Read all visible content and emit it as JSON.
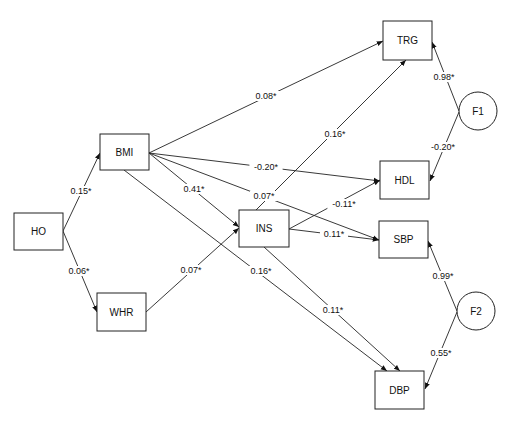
{
  "diagram": {
    "type": "path-diagram",
    "nodes": [
      {
        "id": "HO",
        "label": "HO",
        "shape": "rect",
        "x": 14,
        "y": 213,
        "w": 49,
        "h": 37
      },
      {
        "id": "BMI",
        "label": "BMI",
        "shape": "rect",
        "x": 100,
        "y": 134,
        "w": 49,
        "h": 36
      },
      {
        "id": "WHR",
        "label": "WHR",
        "shape": "rect",
        "x": 97,
        "y": 293,
        "w": 49,
        "h": 38
      },
      {
        "id": "INS",
        "label": "INS",
        "shape": "rect",
        "x": 239,
        "y": 210,
        "w": 50,
        "h": 37
      },
      {
        "id": "TRG",
        "label": "TRG",
        "shape": "rect",
        "x": 383,
        "y": 21,
        "w": 49,
        "h": 39
      },
      {
        "id": "HDL",
        "label": "HDL",
        "shape": "rect",
        "x": 380,
        "y": 161,
        "w": 49,
        "h": 38
      },
      {
        "id": "SBP",
        "label": "SBP",
        "shape": "rect",
        "x": 379,
        "y": 221,
        "w": 49,
        "h": 37
      },
      {
        "id": "DBP",
        "label": "DBP",
        "shape": "rect",
        "x": 375,
        "y": 371,
        "w": 49,
        "h": 38
      },
      {
        "id": "F1",
        "label": "F1",
        "shape": "circle",
        "cx": 478,
        "cy": 111,
        "r": 19
      },
      {
        "id": "F2",
        "label": "F2",
        "shape": "circle",
        "cx": 476,
        "cy": 311,
        "r": 19
      }
    ],
    "edges": [
      {
        "from": "HO",
        "to": "BMI",
        "label": "0.15*",
        "x1": 63,
        "y1": 231,
        "x2": 100,
        "y2": 153,
        "lx": 81,
        "ly": 191
      },
      {
        "from": "HO",
        "to": "WHR",
        "label": "0.06*",
        "x1": 63,
        "y1": 231,
        "x2": 97,
        "y2": 312,
        "lx": 79,
        "ly": 271
      },
      {
        "from": "BMI",
        "to": "TRG",
        "label": "0.08*",
        "x1": 149,
        "y1": 153,
        "x2": 383,
        "y2": 41,
        "lx": 266,
        "ly": 96
      },
      {
        "from": "BMI",
        "to": "HDL",
        "label": "-0.20*",
        "x1": 149,
        "y1": 153,
        "x2": 380,
        "y2": 181,
        "lx": 266,
        "ly": 167
      },
      {
        "from": "BMI",
        "to": "INS",
        "label": "0.41*",
        "x1": 149,
        "y1": 153,
        "x2": 239,
        "y2": 227,
        "lx": 194,
        "ly": 189
      },
      {
        "from": "BMI",
        "to": "SBP",
        "label": "0.07*",
        "x1": 149,
        "y1": 153,
        "x2": 379,
        "y2": 240,
        "lx": 264,
        "ly": 196
      },
      {
        "from": "BMI",
        "to": "DBP",
        "label": "0.16*",
        "x1": 124,
        "y1": 170,
        "x2": 387,
        "y2": 371,
        "lx": 261,
        "ly": 271
      },
      {
        "from": "WHR",
        "to": "INS",
        "label": "0.07*",
        "x1": 146,
        "y1": 312,
        "x2": 239,
        "y2": 228,
        "lx": 191,
        "ly": 270
      },
      {
        "from": "INS",
        "to": "TRG",
        "label": "0.16*",
        "x1": 256,
        "y1": 210,
        "x2": 406,
        "y2": 60,
        "lx": 335,
        "ly": 134
      },
      {
        "from": "INS",
        "to": "HDL",
        "label": "-0.11*",
        "x1": 289,
        "y1": 229,
        "x2": 380,
        "y2": 180,
        "lx": 344,
        "ly": 204
      },
      {
        "from": "INS",
        "to": "SBP",
        "label": "0.11*",
        "x1": 289,
        "y1": 229,
        "x2": 379,
        "y2": 240,
        "lx": 334,
        "ly": 234
      },
      {
        "from": "INS",
        "to": "DBP",
        "label": "0.11*",
        "x1": 264,
        "y1": 247,
        "x2": 400,
        "y2": 371,
        "lx": 333,
        "ly": 310
      },
      {
        "from": "F1",
        "to": "TRG",
        "label": "0.98*",
        "x1": 459,
        "y1": 111,
        "x2": 432,
        "y2": 42,
        "lx": 444,
        "ly": 77
      },
      {
        "from": "F1",
        "to": "HDL",
        "label": "-0.20*",
        "x1": 459,
        "y1": 112,
        "x2": 430,
        "y2": 181,
        "lx": 443,
        "ly": 147
      },
      {
        "from": "F2",
        "to": "SBP",
        "label": "0.99*",
        "x1": 457,
        "y1": 311,
        "x2": 428,
        "y2": 241,
        "lx": 443,
        "ly": 276
      },
      {
        "from": "F2",
        "to": "DBP",
        "label": "0.55*",
        "x1": 457,
        "y1": 312,
        "x2": 425,
        "y2": 389,
        "lx": 441,
        "ly": 353
      }
    ]
  }
}
